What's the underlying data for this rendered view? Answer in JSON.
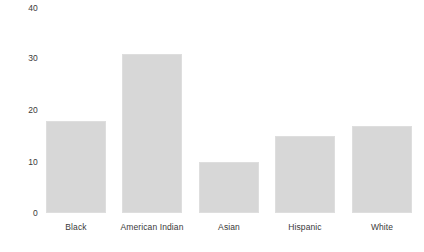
{
  "chart_data": {
    "type": "bar",
    "title": "",
    "subtitle": "",
    "xlabel": "",
    "ylabel": "",
    "categories": [
      "Black",
      "American Indian",
      "Asian",
      "Hispanic",
      "White"
    ],
    "values": [
      18,
      31,
      10,
      15,
      17
    ],
    "ylim": [
      0,
      40
    ],
    "yticks": [
      0,
      10,
      20,
      30,
      40
    ],
    "ytick_labels": [
      "0",
      "10",
      "20",
      "30",
      "40"
    ],
    "grid": false,
    "legend": null,
    "orientation": "vertical",
    "bar_color": "#d7d7d7",
    "bar_border_color": "#dedede",
    "text_color": "#3a3a3a",
    "background": "#ffffff"
  }
}
